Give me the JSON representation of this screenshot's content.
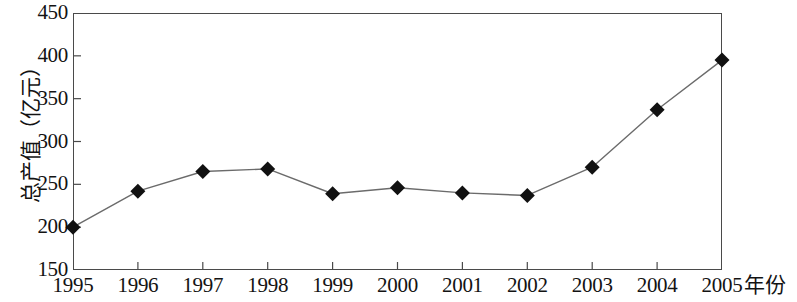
{
  "chart_data": {
    "type": "line",
    "title": "",
    "subtitle": "",
    "xlabel": "年份",
    "ylabel": "总产值（亿元）",
    "categories": [
      "1995",
      "1996",
      "1997",
      "1998",
      "1999",
      "2000",
      "2001",
      "2002",
      "2003",
      "2004",
      "2005"
    ],
    "values": [
      200,
      242,
      265,
      268,
      239,
      246,
      240,
      237,
      270,
      337,
      395
    ],
    "series": [
      {
        "name": "总产值",
        "values": [
          200,
          242,
          265,
          268,
          239,
          246,
          240,
          237,
          270,
          337,
          395
        ]
      }
    ],
    "ylim": [
      150,
      450
    ],
    "yticks": [
      150,
      200,
      250,
      300,
      350,
      400,
      450
    ],
    "ytick_labels": [
      "150",
      "200",
      "250",
      "300",
      "350",
      "400",
      "450"
    ],
    "xtick_labels": [
      "1995",
      "1996",
      "1997",
      "1998",
      "1999",
      "2000",
      "2001",
      "2002",
      "2003",
      "2004",
      "2005"
    ],
    "grid": false,
    "legend": null,
    "legend_position": "none",
    "marker": "diamond",
    "marker_color": "#111111",
    "line_color": "#6b6b6b",
    "frame_color": "#4a4a4a",
    "background_color": "#ffffff",
    "annotations": []
  },
  "axes": {
    "y_title": "总产值（亿元）",
    "x_title": "年份"
  }
}
